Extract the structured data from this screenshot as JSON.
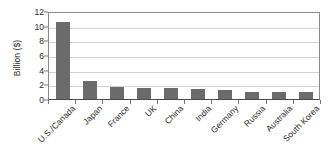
{
  "chart_data": {
    "type": "bar",
    "title": "",
    "subtitle": "",
    "xlabel": "",
    "ylabel": "Billion ($)",
    "ylim": [
      0,
      12
    ],
    "ytick_step": 2,
    "yticks": [
      "12",
      "10",
      "8",
      "6",
      "4",
      "2",
      "0"
    ],
    "grid": true,
    "legend": "none",
    "categories": [
      "U.S./Canada",
      "Japan",
      "France",
      "UK",
      "China",
      "India",
      "Germany",
      "Russia",
      "Australia",
      "South Korea"
    ],
    "values": [
      10.5,
      2.5,
      1.7,
      1.5,
      1.45,
      1.3,
      1.2,
      1.0,
      1.0,
      1.0
    ],
    "bar_color": "#6b6b6b",
    "gridline_color": "#d2d2d2",
    "axis_color": "#8a8a8a",
    "background_color": "#ffffff",
    "text_color": "#2b2b2b"
  }
}
